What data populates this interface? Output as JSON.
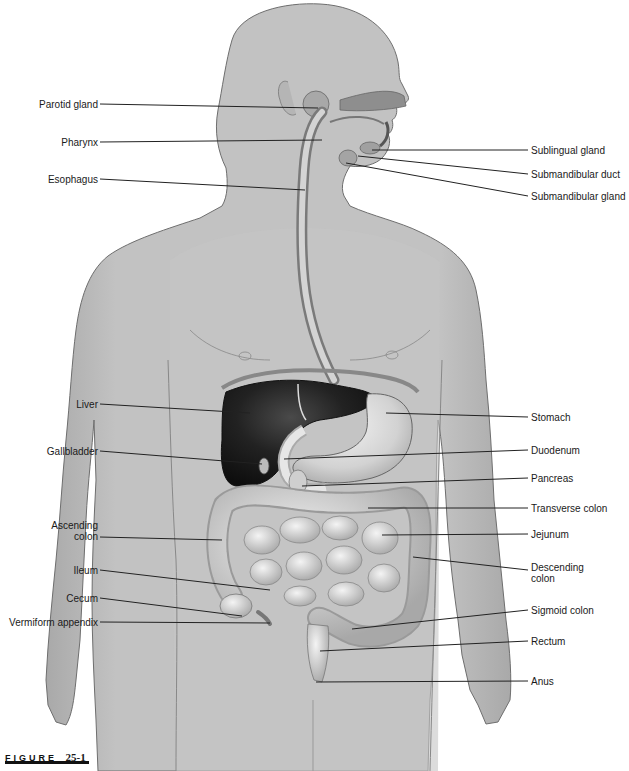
{
  "figure": {
    "label_word": "FIGURE",
    "label_number": "25-1"
  },
  "colors": {
    "skin": "#bdbdbd",
    "skin_light": "#cfcfcf",
    "outline": "#6e6e6e",
    "liver": "#1c1c1c",
    "organ": "#d9d9d9",
    "organ_dark": "#9a9a9a",
    "leader": "#222222"
  },
  "labels_left": [
    {
      "id": "parotid-gland",
      "text": "Parotid gland",
      "x_right": 98,
      "y": 104,
      "target": [
        318,
        108
      ]
    },
    {
      "id": "pharynx",
      "text": "Pharynx",
      "x_right": 98,
      "y": 142,
      "target": [
        322,
        140
      ]
    },
    {
      "id": "esophagus",
      "text": "Esophagus",
      "x_right": 98,
      "y": 179,
      "target": [
        305,
        190
      ]
    },
    {
      "id": "liver",
      "text": "Liver",
      "x_right": 98,
      "y": 404,
      "target": [
        250,
        413
      ]
    },
    {
      "id": "gallbladder",
      "text": "Gallbladder",
      "x_right": 98,
      "y": 451,
      "target": [
        262,
        464
      ]
    },
    {
      "id": "ascending-colon",
      "text": "Ascending\ncolon",
      "x_right": 98,
      "y": 537,
      "target": [
        222,
        540
      ]
    },
    {
      "id": "ileum",
      "text": "Ileum",
      "x_right": 98,
      "y": 570,
      "target": [
        270,
        590
      ]
    },
    {
      "id": "cecum",
      "text": "Cecum",
      "x_right": 98,
      "y": 598,
      "target": [
        242,
        616
      ]
    },
    {
      "id": "vermiform-appendix",
      "text": "Vermiform appendix",
      "x_right": 98,
      "y": 622,
      "target": [
        270,
        623
      ]
    }
  ],
  "labels_right": [
    {
      "id": "sublingual-gland",
      "text": "Sublingual gland",
      "x_left": 530,
      "y": 150,
      "target": [
        372,
        150
      ]
    },
    {
      "id": "submandibular-duct",
      "text": "Submandibular duct",
      "x_left": 530,
      "y": 174,
      "target": [
        358,
        156
      ]
    },
    {
      "id": "submandibular-gland",
      "text": "Submandibular gland",
      "x_left": 530,
      "y": 196,
      "target": [
        346,
        163
      ]
    },
    {
      "id": "stomach",
      "text": "Stomach",
      "x_left": 530,
      "y": 417,
      "target": [
        386,
        413
      ]
    },
    {
      "id": "duodenum",
      "text": "Duodenum",
      "x_left": 530,
      "y": 450,
      "target": [
        284,
        459
      ]
    },
    {
      "id": "pancreas",
      "text": "Pancreas",
      "x_left": 530,
      "y": 478,
      "target": [
        302,
        486
      ]
    },
    {
      "id": "transverse-colon",
      "text": "Transverse colon",
      "x_left": 530,
      "y": 508,
      "target": [
        368,
        508
      ]
    },
    {
      "id": "jejunum",
      "text": "Jejunum",
      "x_left": 530,
      "y": 534,
      "target": [
        382,
        535
      ]
    },
    {
      "id": "descending-colon",
      "text": "Descending\ncolon",
      "x_left": 530,
      "y": 570,
      "target": [
        413,
        557
      ]
    },
    {
      "id": "sigmoid-colon",
      "text": "Sigmoid colon",
      "x_left": 530,
      "y": 610,
      "target": [
        352,
        629
      ]
    },
    {
      "id": "rectum",
      "text": "Rectum",
      "x_left": 530,
      "y": 641,
      "target": [
        320,
        651
      ]
    },
    {
      "id": "anus",
      "text": "Anus",
      "x_left": 530,
      "y": 681,
      "target": [
        316,
        682
      ]
    }
  ]
}
